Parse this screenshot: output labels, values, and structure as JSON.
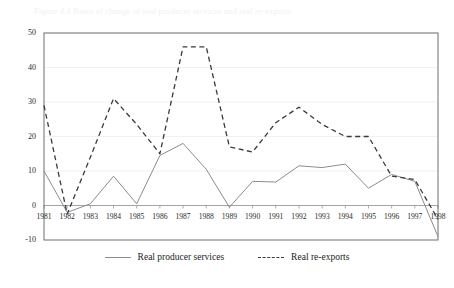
{
  "page": {
    "faint_caption": "Figure 4.4   Rates of change of real producer services and real re-exports"
  },
  "legend": {
    "position": "bottom-center",
    "items": [
      {
        "label": "Real producer services",
        "style": "solid",
        "color": "#8c8c8c",
        "icon": "line-solid-icon"
      },
      {
        "label": "Real re-exports",
        "style": "dashed",
        "color": "#3a3a3a",
        "icon": "line-dashed-icon"
      }
    ]
  },
  "chart_data": {
    "type": "line",
    "title": "",
    "xlabel": "",
    "ylabel": "",
    "ylim": [
      -10,
      50
    ],
    "xlim": [
      "1981",
      "1998"
    ],
    "grid": true,
    "yticks": [
      -10,
      0,
      10,
      20,
      30,
      40,
      50
    ],
    "ytick_labels": [
      "-10",
      "0",
      "10",
      "20",
      "30",
      "40",
      "50"
    ],
    "categories": [
      "1981",
      "1982",
      "1983",
      "1984",
      "1985",
      "1986",
      "1987",
      "1988",
      "1989",
      "1990",
      "1991",
      "1992",
      "1993",
      "1994",
      "1995",
      "1996",
      "1997",
      "1998"
    ],
    "series": [
      {
        "name": "Real producer services",
        "style": "solid",
        "color": "#8c8c8c",
        "values": [
          10.0,
          -2.0,
          0.5,
          8.5,
          0.5,
          14.5,
          18.0,
          10.5,
          -0.5,
          7.0,
          6.8,
          11.5,
          11.0,
          12.0,
          5.0,
          9.0,
          7.0,
          -9.0
        ]
      },
      {
        "name": "Real re-exports",
        "style": "dashed",
        "color": "#3a3a3a",
        "values": [
          29.0,
          -2.5,
          14.0,
          31.0,
          23.5,
          15.0,
          46.0,
          46.0,
          17.0,
          15.5,
          24.0,
          28.5,
          23.5,
          20.0,
          20.0,
          8.5,
          7.5,
          -4.0
        ]
      }
    ]
  },
  "axes": {
    "plot_left_px": 44,
    "plot_right_px": 438,
    "plot_top_px": 33,
    "plot_bottom_px": 240,
    "zero_line_y_px": 203
  }
}
